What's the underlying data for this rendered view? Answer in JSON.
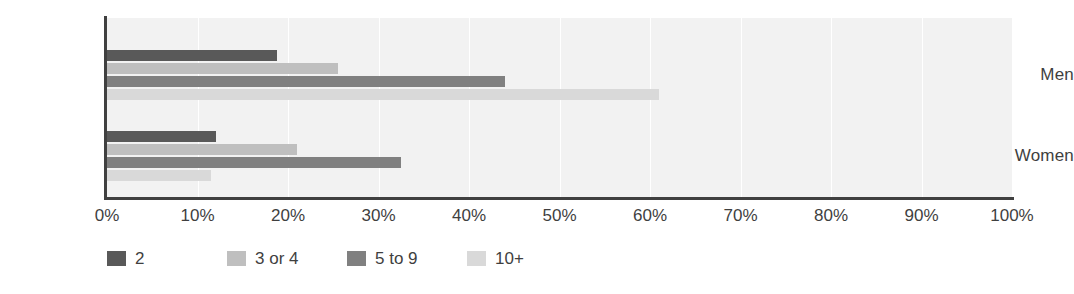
{
  "chart_data": {
    "type": "bar",
    "orientation": "horizontal",
    "title": "",
    "subtitle": "",
    "xlabel": "",
    "ylabel": "",
    "categories": [
      "Men",
      "Women"
    ],
    "series": [
      {
        "name": "2",
        "color": "#595959",
        "values": [
          18.8,
          12.0
        ]
      },
      {
        "name": "3 or 4",
        "color": "#bfbfbf",
        "values": [
          25.5,
          21.0
        ]
      },
      {
        "name": "5 to 9",
        "color": "#808080",
        "values": [
          44.0,
          32.5
        ]
      },
      {
        "name": "10+",
        "color": "#d9d9d9",
        "values": [
          61.0,
          11.5
        ]
      }
    ],
    "xlim": [
      0,
      100
    ],
    "xticks": [
      0,
      10,
      20,
      30,
      40,
      50,
      60,
      70,
      80,
      90,
      100
    ],
    "xtick_labels": [
      "0%",
      "10%",
      "20%",
      "30%",
      "40%",
      "50%",
      "60%",
      "70%",
      "80%",
      "90%",
      "100%"
    ],
    "grid": {
      "vertical": true,
      "horizontal": false,
      "color": "#ffffff"
    },
    "legend": {
      "position": "bottom-left",
      "entries": [
        "2",
        "3 or 4",
        "5 to 9",
        "10+"
      ]
    },
    "plot_background": "#f2f2f2",
    "axis_color": "#404040",
    "text_color": "#3f3f3f"
  }
}
